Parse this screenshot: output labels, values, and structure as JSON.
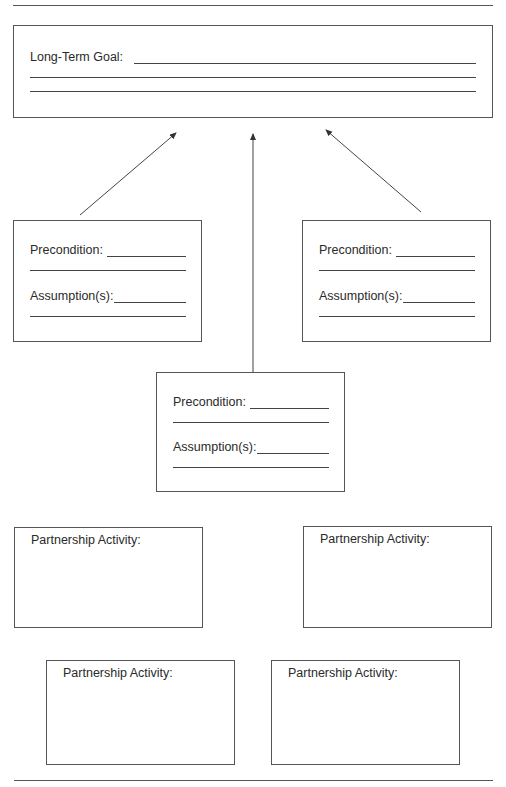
{
  "goal_box": {
    "label": "Long-Term  Goal:"
  },
  "precondition_boxes": [
    {
      "precondition_label": "Precondition:",
      "assumption_label": "Assumption(s):"
    },
    {
      "precondition_label": "Precondition:",
      "assumption_label": "Assumption(s):"
    },
    {
      "precondition_label": "Precondition:",
      "assumption_label": "Assumption(s):"
    }
  ],
  "activity_boxes": [
    {
      "label": "Partnership Activity:"
    },
    {
      "label": "Partnership Activity:"
    },
    {
      "label": "Partnership Activity:"
    },
    {
      "label": "Partnership Activity:"
    }
  ],
  "colors": {
    "line": "#555555",
    "text": "#2a2a2a",
    "background": "#ffffff"
  }
}
